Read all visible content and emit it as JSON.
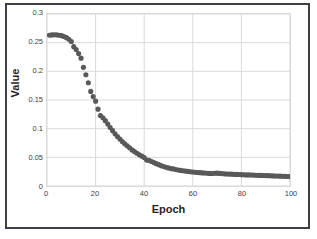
{
  "chart_data": {
    "type": "scatter",
    "title": "",
    "xlabel": "Epoch",
    "ylabel": "Value",
    "xlim": [
      0,
      100
    ],
    "ylim": [
      0,
      0.3
    ],
    "grid": true,
    "legend": "none",
    "marker": {
      "shape": "circle",
      "color": "#595959",
      "size_px": 2.6
    },
    "xticks": [
      0,
      20,
      40,
      60,
      80,
      100
    ],
    "xtick_labels": [
      "0",
      "20",
      "40",
      "60",
      "80",
      "100"
    ],
    "yticks": [
      0,
      0.05,
      0.1,
      0.15,
      0.2,
      0.25,
      0.3
    ],
    "ytick_labels": [
      "0",
      "0.05",
      "0.1",
      "0.15",
      "0.2",
      "0.25",
      "0.3"
    ],
    "series": [
      {
        "name": "Value",
        "x": [
          1,
          2,
          3,
          4,
          5,
          6,
          7,
          8,
          9,
          10,
          11,
          12,
          13,
          14,
          15,
          16,
          17,
          18,
          19,
          20,
          21,
          22,
          23,
          24,
          25,
          26,
          27,
          28,
          29,
          30,
          31,
          32,
          33,
          34,
          35,
          36,
          37,
          38,
          39,
          40,
          41,
          42,
          43,
          44,
          45,
          46,
          47,
          48,
          49,
          50,
          51,
          52,
          53,
          54,
          55,
          56,
          57,
          58,
          59,
          60,
          61,
          62,
          63,
          64,
          65,
          66,
          67,
          68,
          69,
          70,
          71,
          72,
          73,
          74,
          75,
          76,
          77,
          78,
          79,
          80,
          81,
          82,
          83,
          84,
          85,
          86,
          87,
          88,
          89,
          90,
          91,
          92,
          93,
          94,
          95,
          96,
          97,
          98,
          99,
          100
        ],
        "y": [
          0.263,
          0.2635,
          0.2638,
          0.2636,
          0.263,
          0.2622,
          0.2608,
          0.2588,
          0.256,
          0.252,
          0.243,
          0.238,
          0.231,
          0.223,
          0.207,
          0.194,
          0.18,
          0.165,
          0.156,
          0.148,
          0.134,
          0.123,
          0.119,
          0.114,
          0.108,
          0.102,
          0.0965,
          0.091,
          0.0862,
          0.0818,
          0.0775,
          0.0735,
          0.07,
          0.0668,
          0.063,
          0.06,
          0.0572,
          0.0545,
          0.052,
          0.0495,
          0.0452,
          0.0448,
          0.0428,
          0.0408,
          0.039,
          0.0372,
          0.0355,
          0.034,
          0.0328,
          0.0315,
          0.0304,
          0.0298,
          0.0288,
          0.028,
          0.0272,
          0.0266,
          0.026,
          0.0254,
          0.0248,
          0.0244,
          0.024,
          0.0236,
          0.0232,
          0.0228,
          0.0226,
          0.0222,
          0.022,
          0.0219,
          0.0222,
          0.0224,
          0.022,
          0.0216,
          0.0212,
          0.021,
          0.0208,
          0.0206,
          0.0204,
          0.0202,
          0.02,
          0.0198,
          0.0196,
          0.0194,
          0.0193,
          0.0192,
          0.019,
          0.0188,
          0.0186,
          0.0185,
          0.0184,
          0.0182,
          0.018,
          0.0178,
          0.0176,
          0.0175,
          0.0174,
          0.0172,
          0.017,
          0.0168,
          0.0166,
          0.0164
        ]
      }
    ]
  }
}
